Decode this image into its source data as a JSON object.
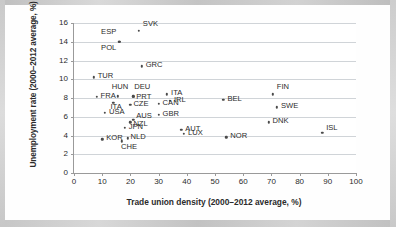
{
  "chart_data": {
    "type": "scatter",
    "title": "",
    "xlabel": "Trade union density (2000–2012 average, %)",
    "ylabel": "Unemployment rate (2000–2012 average, %)",
    "xlim": [
      0,
      100
    ],
    "ylim": [
      0,
      16
    ],
    "xticks": [
      0,
      10,
      20,
      30,
      40,
      50,
      60,
      70,
      80,
      90,
      100
    ],
    "yticks": [
      0,
      2,
      4,
      6,
      8,
      10,
      12,
      14,
      16
    ],
    "xtick_labels": [
      "0",
      "10",
      "20",
      "30",
      "40",
      "50",
      "60",
      "70",
      "80",
      "90",
      "100"
    ],
    "ytick_labels": [
      "0",
      "2",
      "4",
      "6",
      "8",
      "10",
      "12",
      "14",
      "16"
    ],
    "grid": "horizontal",
    "legend": "none",
    "marker_color": "#4a4a4a",
    "points": [
      {
        "label": "SVK",
        "x": 23.0,
        "y": 15.2,
        "lx": 4,
        "ly": -8
      },
      {
        "label": "ESP",
        "x": 16.0,
        "y": 14.0,
        "lx": -18,
        "ly": -11
      },
      {
        "label": "POL",
        "x": 16.0,
        "y": 14.0,
        "lx": -18,
        "ly": 5
      },
      {
        "label": "GRC",
        "x": 24.0,
        "y": 11.4,
        "lx": 4,
        "ly": -2
      },
      {
        "label": "TUR",
        "x": 7.0,
        "y": 10.2,
        "lx": 4,
        "ly": -2
      },
      {
        "label": "HUN",
        "x": 15.5,
        "y": 8.2,
        "lx": -6,
        "ly": -10
      },
      {
        "label": "DEU",
        "x": 21.0,
        "y": 8.2,
        "lx": 1,
        "ly": -10
      },
      {
        "label": "PRT",
        "x": 21.0,
        "y": 8.1,
        "lx": 3,
        "ly": -1
      },
      {
        "label": "FRA",
        "x": 8.0,
        "y": 8.1,
        "lx": 4,
        "ly": -2
      },
      {
        "label": "ITA",
        "x": 33.0,
        "y": 8.4,
        "lx": 4,
        "ly": -2
      },
      {
        "label": "IRL",
        "x": 34.0,
        "y": 7.7,
        "lx": 4,
        "ly": -2
      },
      {
        "label": "BEL",
        "x": 53.0,
        "y": 7.8,
        "lx": 4,
        "ly": -2
      },
      {
        "label": "FIN",
        "x": 70.5,
        "y": 8.4,
        "lx": 4,
        "ly": -8
      },
      {
        "label": "ITA",
        "x": 14.0,
        "y": 7.5,
        "lx": -3,
        "ly": 3
      },
      {
        "label": "CZE",
        "x": 20.0,
        "y": 7.3,
        "lx": 3,
        "ly": -2
      },
      {
        "label": "CAN",
        "x": 30.0,
        "y": 7.4,
        "lx": 4,
        "ly": -2
      },
      {
        "label": "SWE",
        "x": 72.0,
        "y": 7.0,
        "lx": 4,
        "ly": -2
      },
      {
        "label": "USA",
        "x": 11.0,
        "y": 6.4,
        "lx": 4,
        "ly": -2
      },
      {
        "label": "GBR",
        "x": 30.0,
        "y": 6.2,
        "lx": 4,
        "ly": -2
      },
      {
        "label": "AUS",
        "x": 21.0,
        "y": 5.7,
        "lx": 3,
        "ly": -5
      },
      {
        "label": "NZL",
        "x": 20.0,
        "y": 5.4,
        "lx": 3,
        "ly": 1
      },
      {
        "label": "DNK",
        "x": 69.0,
        "y": 5.4,
        "lx": 4,
        "ly": -2
      },
      {
        "label": "JPN",
        "x": 18.0,
        "y": 4.8,
        "lx": 4,
        "ly": -2
      },
      {
        "label": "AUT",
        "x": 38.0,
        "y": 4.6,
        "lx": 4,
        "ly": -2
      },
      {
        "label": "LUX",
        "x": 39.0,
        "y": 4.2,
        "lx": 4,
        "ly": -2
      },
      {
        "label": "NOR",
        "x": 54.0,
        "y": 3.8,
        "lx": 4,
        "ly": -2
      },
      {
        "label": "ISL",
        "x": 88.0,
        "y": 4.3,
        "lx": 4,
        "ly": -6
      },
      {
        "label": "KOR",
        "x": 10.0,
        "y": 3.6,
        "lx": 4,
        "ly": -2
      },
      {
        "label": "NLD",
        "x": 19.0,
        "y": 3.7,
        "lx": 3,
        "ly": -2
      },
      {
        "label": "CHE",
        "x": 17.0,
        "y": 3.4,
        "lx": -1,
        "ly": 5
      }
    ]
  }
}
